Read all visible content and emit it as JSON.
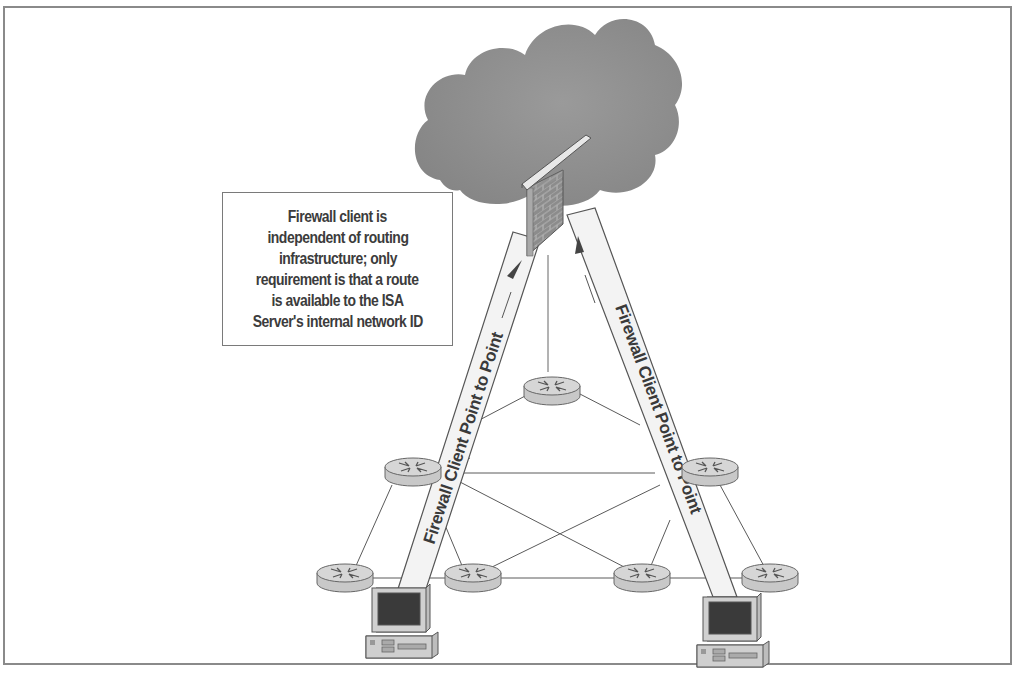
{
  "diagram": {
    "type": "network-diagram",
    "callout": {
      "lines": [
        "Firewall client is",
        "independent of routing",
        "infrastructure;  only",
        "requirement is that a route",
        "is available to the ISA",
        "Server's internal network ID"
      ]
    },
    "beams": {
      "left_label": "Firewall Client Point to Point",
      "right_label": "Firewall Client Point to Point"
    },
    "nodes": {
      "cloud": "internet-cloud",
      "firewall": "firewall-brick-wall",
      "routers": [
        "router-top",
        "router-mid-left",
        "router-mid-right",
        "router-bottom-left",
        "router-bottom-center-left",
        "router-bottom-center-right",
        "router-bottom-right"
      ],
      "clients": [
        "client-pc-left",
        "client-pc-right"
      ]
    },
    "colors": {
      "frame": "#8a8a8a",
      "cloud": "#8f8f8f",
      "wall": "#8c8c8c",
      "router_fill": "#cfcfcf",
      "line": "#555555",
      "beam_fill": "#f4f4f4",
      "text": "#3a3a3a"
    }
  }
}
